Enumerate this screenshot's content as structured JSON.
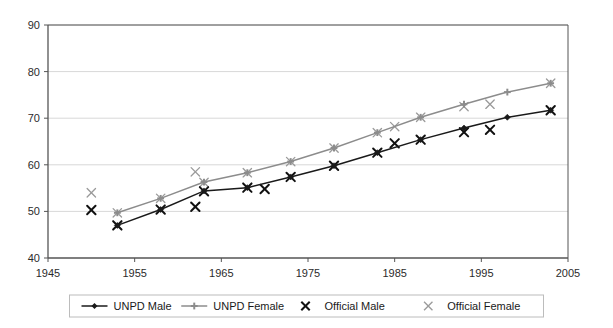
{
  "chart_data": {
    "type": "line",
    "title": "",
    "subtitle": "",
    "xlabel": "",
    "ylabel": "",
    "xlim": [
      1945,
      2005
    ],
    "ylim": [
      40,
      90
    ],
    "xticks": [
      1945,
      1955,
      1965,
      1975,
      1985,
      1995,
      2005
    ],
    "yticks": [
      40,
      50,
      60,
      70,
      80,
      90
    ],
    "grid": "horizontal",
    "legend_position": "bottom",
    "series": [
      {
        "name": "UNPD Male",
        "marker": "diamond",
        "color": "#1a1a1a",
        "style": "line-marker",
        "points": [
          [
            1953,
            47.0
          ],
          [
            1958,
            50.4
          ],
          [
            1963,
            54.4
          ],
          [
            1968,
            55.1
          ],
          [
            1973,
            57.4
          ],
          [
            1978,
            59.8
          ],
          [
            1983,
            62.6
          ],
          [
            1988,
            65.4
          ],
          [
            1993,
            67.9
          ],
          [
            1998,
            70.2
          ],
          [
            2003,
            71.7
          ]
        ]
      },
      {
        "name": "UNPD Female",
        "marker": "plus",
        "color": "#8c8c8c",
        "style": "line-marker",
        "points": [
          [
            1953,
            49.7
          ],
          [
            1958,
            52.8
          ],
          [
            1963,
            56.3
          ],
          [
            1968,
            58.3
          ],
          [
            1973,
            60.7
          ],
          [
            1978,
            63.6
          ],
          [
            1983,
            66.9
          ],
          [
            1988,
            70.2
          ],
          [
            1993,
            73.0
          ],
          [
            1998,
            75.6
          ],
          [
            2003,
            77.5
          ]
        ]
      },
      {
        "name": "Official Male",
        "marker": "x-bold",
        "color": "#111111",
        "style": "scatter",
        "points": [
          [
            1950,
            50.3
          ],
          [
            1953,
            47.0
          ],
          [
            1958,
            50.4
          ],
          [
            1962,
            51.0
          ],
          [
            1963,
            54.3
          ],
          [
            1968,
            55.1
          ],
          [
            1970,
            54.8
          ],
          [
            1973,
            57.4
          ],
          [
            1978,
            59.8
          ],
          [
            1983,
            62.6
          ],
          [
            1985,
            64.6
          ],
          [
            1988,
            65.4
          ],
          [
            1993,
            67.0
          ],
          [
            1996,
            67.5
          ],
          [
            2003,
            71.7
          ]
        ]
      },
      {
        "name": "Official Female",
        "marker": "x-light",
        "color": "#9a9a9a",
        "style": "scatter",
        "points": [
          [
            1950,
            54.0
          ],
          [
            1953,
            49.7
          ],
          [
            1958,
            52.8
          ],
          [
            1962,
            58.5
          ],
          [
            1963,
            56.2
          ],
          [
            1968,
            58.3
          ],
          [
            1973,
            60.7
          ],
          [
            1978,
            63.6
          ],
          [
            1983,
            66.9
          ],
          [
            1985,
            68.2
          ],
          [
            1988,
            70.2
          ],
          [
            1993,
            72.5
          ],
          [
            1996,
            73.0
          ],
          [
            2003,
            77.5
          ]
        ]
      }
    ]
  },
  "legend": {
    "items": [
      {
        "label": "UNPD Male"
      },
      {
        "label": "UNPD Female"
      },
      {
        "label": "Official Male"
      },
      {
        "label": "Official Female"
      }
    ]
  },
  "colors": {
    "unpd_male": "#1a1a1a",
    "unpd_female": "#8c8c8c",
    "official_male": "#111111",
    "official_female": "#9a9a9a",
    "axis": "#555555",
    "grid": "#d8d8d8",
    "background": "#ffffff"
  }
}
